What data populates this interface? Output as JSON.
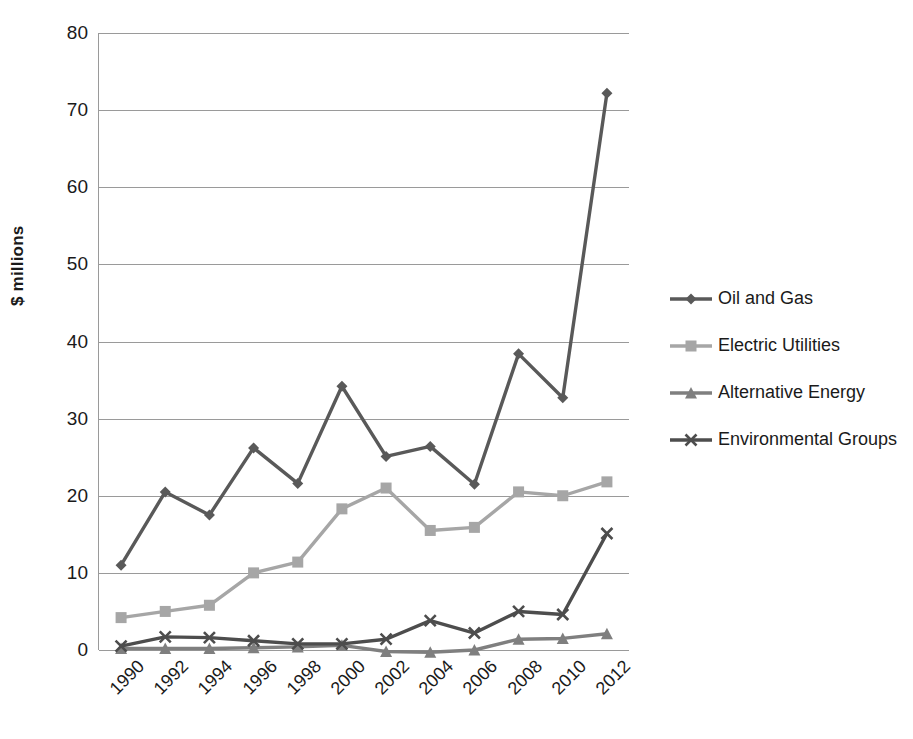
{
  "chart_data": {
    "type": "line",
    "title": "",
    "xlabel": "",
    "ylabel": "$ millions",
    "categories": [
      "1990",
      "1992",
      "1994",
      "1996",
      "1998",
      "2000",
      "2002",
      "2004",
      "2006",
      "2008",
      "2010",
      "2012"
    ],
    "ylim": [
      0,
      80
    ],
    "ytick_values": [
      0,
      10,
      20,
      30,
      40,
      50,
      60,
      70,
      80
    ],
    "ytick_labels": [
      "0",
      "10",
      "20",
      "30",
      "40",
      "50",
      "60",
      "70",
      "80"
    ],
    "grid": true,
    "legend_position": "right",
    "series": [
      {
        "name": "Oil and Gas",
        "marker": "diamond",
        "color": "#595959",
        "values": [
          11.0,
          20.5,
          17.5,
          26.2,
          21.6,
          34.2,
          25.1,
          26.4,
          21.5,
          38.4,
          32.7,
          72.2
        ]
      },
      {
        "name": "Electric Utilities",
        "marker": "square",
        "color": "#a6a6a6",
        "values": [
          4.2,
          5.0,
          5.8,
          10.0,
          11.4,
          18.3,
          21.0,
          15.5,
          15.9,
          20.5,
          20.0,
          21.8
        ]
      },
      {
        "name": "Alternative Energy",
        "marker": "triangle",
        "color": "#7f7f7f",
        "values": [
          0.2,
          0.2,
          0.2,
          0.3,
          0.4,
          0.6,
          -0.2,
          -0.3,
          0.0,
          1.4,
          1.5,
          2.1
        ]
      },
      {
        "name": "Environmental Groups",
        "marker": "x",
        "color": "#4d4d4d",
        "values": [
          0.5,
          1.7,
          1.6,
          1.2,
          0.8,
          0.8,
          1.4,
          3.8,
          2.2,
          5.0,
          4.6,
          15.1
        ]
      }
    ]
  }
}
